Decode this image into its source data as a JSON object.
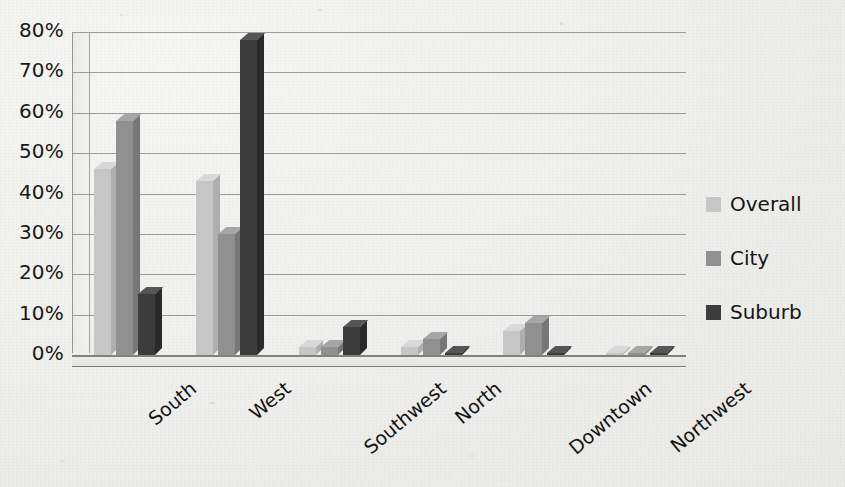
{
  "chart_data": {
    "type": "bar",
    "title": "",
    "subtitle": "",
    "xlabel": "",
    "ylabel": "",
    "ylim": [
      0,
      80
    ],
    "ytick_labels": [
      "80%",
      "70%",
      "60%",
      "50%",
      "40%",
      "30%",
      "20%",
      "10%",
      "0%"
    ],
    "ytick_values": [
      80,
      70,
      60,
      50,
      40,
      30,
      20,
      10,
      0
    ],
    "grid": true,
    "legend_position": "right",
    "style": "3d-clustered-column",
    "categories": [
      "South",
      "West",
      "Southwest",
      "North",
      "Downtown",
      "Northwest"
    ],
    "series": [
      {
        "name": "Overall",
        "color": "#c6c6c6",
        "values": [
          46,
          43,
          2,
          2,
          6,
          0.5
        ]
      },
      {
        "name": "City",
        "color": "#909090",
        "values": [
          58,
          30,
          2,
          4,
          8,
          0.5
        ]
      },
      {
        "name": "Suburb",
        "color": "#3c3c3c",
        "values": [
          15,
          78,
          7,
          0.5,
          0.5,
          0.5
        ]
      }
    ]
  },
  "legend": {
    "items": [
      {
        "label": "Overall",
        "swatch": "overall-swatch"
      },
      {
        "label": "City",
        "swatch": "city-swatch"
      },
      {
        "label": "Suburb",
        "swatch": "suburb-swatch"
      }
    ]
  },
  "colors": {
    "overall": "#c6c6c6",
    "city": "#909090",
    "suburb": "#3c3c3c",
    "gridline": "#8d8d8d",
    "background": "#f1f1ef",
    "text": "#151515"
  }
}
